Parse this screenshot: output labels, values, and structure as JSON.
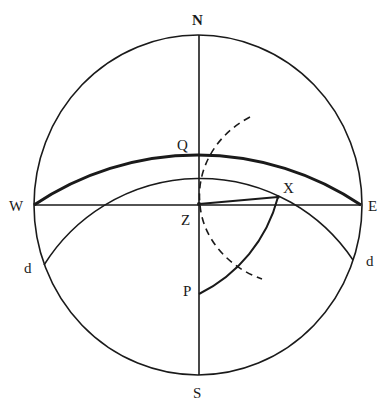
{
  "diagram": {
    "type": "celestial-sphere-projection",
    "labels": {
      "north": "N",
      "south": "S",
      "west": "W",
      "east": "E",
      "zenith": "Z",
      "pole": "P",
      "equator_point": "Q",
      "star": "X",
      "declination_left": "d",
      "declination_right": "d"
    },
    "elements": [
      {
        "name": "horizon-circle",
        "style": "solid"
      },
      {
        "name": "meridian-line",
        "from": "N",
        "to": "S",
        "style": "solid"
      },
      {
        "name": "prime-vertical-line",
        "from": "W",
        "to": "E",
        "style": "solid"
      },
      {
        "name": "celestial-equator-arc",
        "from": "W",
        "through": "Q",
        "to": "E",
        "style": "thick"
      },
      {
        "name": "declination-arc",
        "from": "d",
        "to": "d",
        "style": "thin"
      },
      {
        "name": "hour-circle-arc",
        "from": "P",
        "to": "X",
        "style": "solid"
      },
      {
        "name": "altitude-line",
        "from": "Z",
        "to": "X",
        "style": "solid"
      },
      {
        "name": "construction-arc",
        "style": "dashed"
      }
    ],
    "colors": {
      "line": "#1a1a1a",
      "background": "#ffffff"
    }
  }
}
